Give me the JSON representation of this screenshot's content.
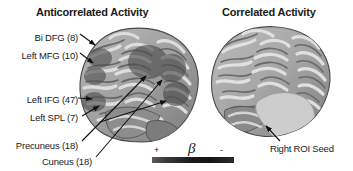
{
  "figure": {
    "background_color": "#ffffff"
  },
  "panels": {
    "left": {
      "title": "Anticorrelated Activity",
      "view": "left-lateral-brain-surface"
    },
    "right": {
      "title": "Correlated Activity",
      "view": "right-lateral-brain-surface"
    }
  },
  "roi_labels": [
    {
      "id": "bi-dfg",
      "text": "Bi DFG (8)"
    },
    {
      "id": "left-mfg",
      "text": "Left MFG (10)"
    },
    {
      "id": "left-ifg",
      "text": "Left IFG (47)"
    },
    {
      "id": "left-spl",
      "text": "Left SPL (7)"
    },
    {
      "id": "precuneus",
      "text": "Precuneus (18)"
    },
    {
      "id": "cuneus",
      "text": "Cuneus (18)"
    },
    {
      "id": "right-roi",
      "text": "Right ROI Seed"
    }
  ],
  "colorbar": {
    "symbol": "β",
    "positive_sign": "+",
    "negative_sign": "-",
    "gradient_start_color": "#5c5c5c",
    "gradient_end_color": "#161616"
  },
  "colors": {
    "brain_surface_light": "#d8d8d8",
    "brain_surface_mid": "#9a9a9a",
    "brain_sulci_dark": "#6b6b6b",
    "activation_dark": "#595959",
    "roi_seed_light": "#c9c9c9",
    "text": "#1a1a1a",
    "arrow": "#111111"
  }
}
